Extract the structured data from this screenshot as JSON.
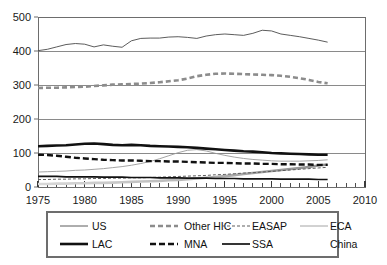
{
  "chart_data": {
    "type": "line",
    "title": "",
    "subtitle": "",
    "xlabel": "",
    "ylabel": "",
    "xlim": [
      1975,
      2010
    ],
    "ylim": [
      0,
      500
    ],
    "grid": true,
    "legend_position": "bottom",
    "ytick_labels": [
      "0",
      "100",
      "200",
      "300",
      "400",
      "500"
    ],
    "yticks": [
      0,
      100,
      200,
      300,
      400,
      500
    ],
    "xtick_labels": [
      "1975",
      "1980",
      "1985",
      "1990",
      "1995",
      "2000",
      "2005",
      "2010"
    ],
    "xticks": [
      1975,
      1980,
      1985,
      1990,
      1995,
      2000,
      2005,
      2010
    ],
    "minor_xtick_interval": 1,
    "x": [
      1975,
      1976,
      1977,
      1978,
      1979,
      1980,
      1981,
      1982,
      1983,
      1984,
      1985,
      1986,
      1987,
      1988,
      1989,
      1990,
      1991,
      1992,
      1993,
      1994,
      1995,
      1996,
      1997,
      1998,
      1999,
      2000,
      2001,
      2002,
      2003,
      2004,
      2005,
      2006
    ],
    "series": [
      {
        "name": "US",
        "style": "thin-solid",
        "color": "#4a4a4a",
        "values": [
          401,
          405,
          412,
          419,
          422,
          420,
          412,
          418,
          414,
          411,
          430,
          437,
          438,
          438,
          441,
          442,
          440,
          437,
          444,
          448,
          450,
          448,
          446,
          452,
          461,
          459,
          450,
          446,
          442,
          437,
          432,
          426
        ]
      },
      {
        "name": "Other HIC",
        "style": "thick-dashed",
        "color": "#8c8c8c",
        "values": [
          291,
          292,
          292,
          293,
          294,
          295,
          297,
          299,
          301,
          302,
          303,
          304,
          306,
          308,
          311,
          314,
          319,
          326,
          330,
          333,
          334,
          333,
          332,
          331,
          330,
          329,
          327,
          324,
          320,
          315,
          309,
          305
        ]
      },
      {
        "name": "EASAP",
        "style": "fine-dashed",
        "color": "#555555",
        "values": [
          22,
          22,
          23,
          23,
          24,
          24,
          25,
          25,
          26,
          26,
          27,
          27,
          28,
          29,
          30,
          31,
          32,
          33,
          34,
          36,
          37,
          39,
          41,
          42,
          44,
          46,
          48,
          50,
          52,
          54,
          56,
          58
        ]
      },
      {
        "name": "ECA",
        "style": "thin-solid-light",
        "color": "#9a9a9a",
        "values": [
          44,
          45,
          46,
          47,
          49,
          50,
          52,
          54,
          57,
          60,
          64,
          69,
          75,
          83,
          92,
          101,
          108,
          110,
          106,
          99,
          93,
          88,
          84,
          81,
          79,
          77,
          76,
          76,
          76,
          77,
          78,
          80
        ]
      },
      {
        "name": "LAC",
        "style": "thick-solid",
        "color": "#111111",
        "values": [
          120,
          121,
          122,
          123,
          125,
          127,
          128,
          126,
          124,
          123,
          124,
          123,
          121,
          120,
          119,
          118,
          117,
          115,
          113,
          111,
          109,
          107,
          105,
          104,
          102,
          100,
          99,
          98,
          97,
          96,
          95,
          95
        ]
      },
      {
        "name": "MNA",
        "style": "thick-dashed-dark",
        "color": "#111111",
        "values": [
          95,
          94,
          92,
          89,
          86,
          84,
          82,
          80,
          79,
          78,
          78,
          77,
          76,
          76,
          75,
          75,
          74,
          73,
          72,
          71,
          71,
          70,
          69,
          69,
          68,
          68,
          67,
          67,
          66,
          66,
          65,
          65
        ]
      },
      {
        "name": "SSA",
        "style": "thick-solid-thin",
        "color": "#111111",
        "values": [
          31,
          31,
          31,
          30,
          30,
          30,
          30,
          29,
          29,
          29,
          28,
          28,
          28,
          27,
          27,
          27,
          26,
          26,
          26,
          25,
          25,
          25,
          24,
          24,
          24,
          24,
          23,
          23,
          23,
          23,
          22,
          22
        ]
      },
      {
        "name": "China",
        "style": "thick-gray-gradient",
        "color": "#b5b5b5",
        "values": [
          9,
          9,
          10,
          10,
          11,
          11,
          12,
          12,
          13,
          14,
          15,
          16,
          17,
          18,
          20,
          21,
          23,
          25,
          27,
          29,
          32,
          35,
          38,
          41,
          44,
          47,
          50,
          53,
          56,
          59,
          63,
          66
        ]
      }
    ]
  },
  "legend": {
    "items": [
      {
        "label": "US",
        "style": "thin-solid"
      },
      {
        "label": "Other HIC",
        "style": "thick-dashed"
      },
      {
        "label": "EASAP",
        "style": "fine-dashed"
      },
      {
        "label": "ECA",
        "style": "thin-solid-light"
      },
      {
        "label": "LAC",
        "style": "thick-solid"
      },
      {
        "label": "MNA",
        "style": "thick-dashed-dark"
      },
      {
        "label": "SSA",
        "style": "thick-solid-thin"
      },
      {
        "label": "China",
        "style": "thick-gray-gradient"
      }
    ]
  },
  "colors": {
    "background": "#ffffff",
    "axis": "#6d6d6d",
    "grid": "#8a8a8a",
    "text": "#1a1a1a",
    "legend_border": "#6d6d6d"
  }
}
